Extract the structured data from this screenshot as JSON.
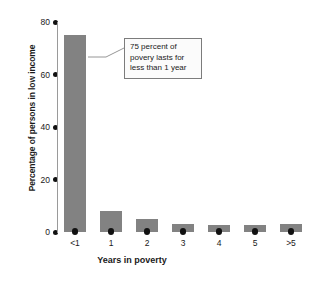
{
  "chart_data": {
    "type": "bar",
    "title": "",
    "xlabel": "Years in poverty",
    "ylabel": "Percentage of persons in low income",
    "categories": [
      "<1",
      "1",
      "2",
      "3",
      "4",
      "5",
      ">5"
    ],
    "values": [
      75,
      8,
      5,
      3,
      2.5,
      2.5,
      3
    ],
    "ylim": [
      0,
      80
    ],
    "yticks": [
      "0",
      "20",
      "40",
      "60",
      "80"
    ],
    "ytick_values": [
      0,
      20,
      40,
      60,
      80
    ],
    "grid": false,
    "legend": null,
    "bar_color": "#828282",
    "annotations": [
      {
        "name": "callout-75-percent",
        "lines": [
          "75 percent of",
          "povery lasts for",
          "less than 1 year"
        ],
        "text": "75 percent of povery lasts for less than 1 year",
        "points_to_category": "<1"
      }
    ]
  }
}
